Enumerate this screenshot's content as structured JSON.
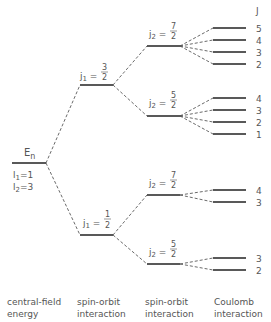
{
  "diagram": {
    "type": "energy-level-diagram",
    "column_header": "J",
    "initial_level": {
      "label": "E",
      "label_sub": "n",
      "quantum_numbers": [
        {
          "symbol": "l",
          "sub": "1",
          "value": "1"
        },
        {
          "symbol": "l",
          "sub": "2",
          "value": "3"
        }
      ]
    },
    "spin_orbit_1": [
      {
        "symbol": "j",
        "sub": "1",
        "num": "3",
        "den": "2"
      },
      {
        "symbol": "j",
        "sub": "1",
        "num": "1",
        "den": "2"
      }
    ],
    "spin_orbit_2": [
      {
        "symbol": "j",
        "sub": "2",
        "num": "7",
        "den": "2",
        "parent": "j1=3/2"
      },
      {
        "symbol": "j",
        "sub": "2",
        "num": "5",
        "den": "2",
        "parent": "j1=3/2"
      },
      {
        "symbol": "j",
        "sub": "2",
        "num": "7",
        "den": "2",
        "parent": "j1=1/2"
      },
      {
        "symbol": "j",
        "sub": "2",
        "num": "5",
        "den": "2",
        "parent": "j1=1/2"
      }
    ],
    "coulomb_J_values": {
      "group1": [
        "5",
        "4",
        "3",
        "2"
      ],
      "group2": [
        "4",
        "3",
        "2",
        "1"
      ],
      "group3": [
        "4",
        "3"
      ],
      "group4": [
        "3",
        "2"
      ]
    },
    "captions": [
      {
        "line1": "central-field",
        "line2": "energy"
      },
      {
        "line1": "spin-orbit",
        "line2": "interaction"
      },
      {
        "line1": "spin-orbit",
        "line2": "interaction"
      },
      {
        "line1": "Coulomb",
        "line2": "interaction"
      }
    ],
    "colors": {
      "line": "#222222",
      "text": "#555555",
      "dash": "#444444"
    }
  }
}
